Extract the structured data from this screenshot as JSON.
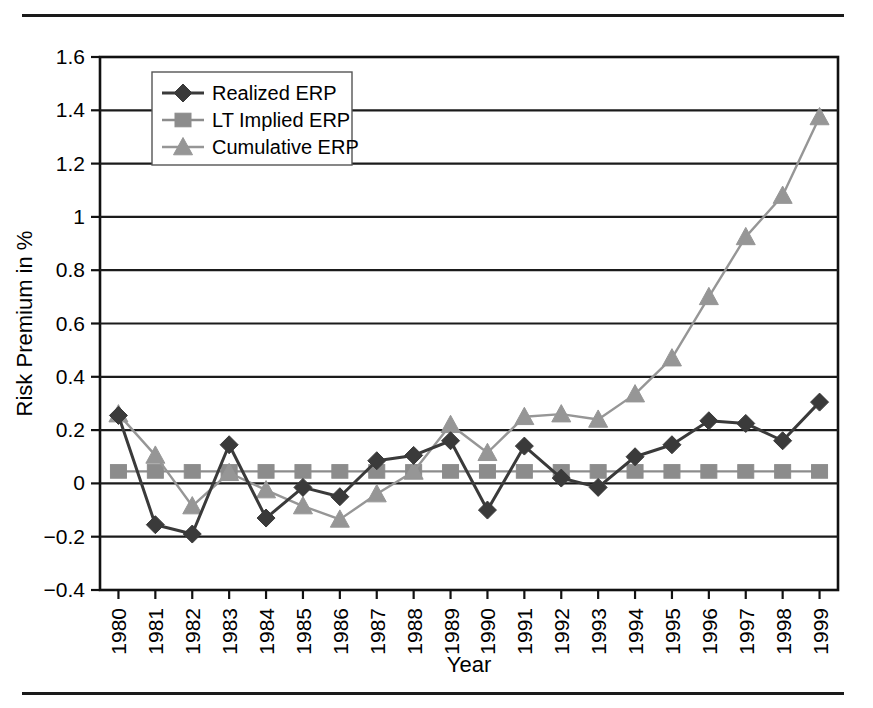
{
  "figure": {
    "top_rule": "horizontal-rule",
    "bottom_rule": "horizontal-rule"
  },
  "chart_data": {
    "type": "line",
    "title": "",
    "xlabel": "Year",
    "ylabel": "Risk Premium in %",
    "categories": [
      "1980",
      "1981",
      "1982",
      "1983",
      "1984",
      "1985",
      "1986",
      "1987",
      "1988",
      "1989",
      "1990",
      "1991",
      "1992",
      "1993",
      "1994",
      "1995",
      "1996",
      "1997",
      "1998",
      "1999"
    ],
    "x": [
      1980,
      1981,
      1982,
      1983,
      1984,
      1985,
      1986,
      1987,
      1988,
      1989,
      1990,
      1991,
      1992,
      1993,
      1994,
      1995,
      1996,
      1997,
      1998,
      1999
    ],
    "ylim": [
      -0.4,
      1.6
    ],
    "yticks": [
      -0.4,
      -0.2,
      0,
      0.2,
      0.4,
      0.6,
      0.8,
      1,
      1.2,
      1.4,
      1.6
    ],
    "ytick_labels": [
      "-0.4",
      "-0.2",
      "0",
      "0.2",
      "0.4",
      "0.6",
      "0.8",
      "1",
      "1.2",
      "1.4",
      "1.6"
    ],
    "grid": true,
    "legend_position": "top-left",
    "series": [
      {
        "name": "Realized ERP",
        "marker": "diamond",
        "color": "#3a3a3a",
        "values": [
          0.255,
          -0.155,
          -0.19,
          0.145,
          -0.13,
          -0.015,
          -0.05,
          0.085,
          0.105,
          0.16,
          -0.1,
          0.14,
          0.02,
          -0.015,
          0.1,
          0.145,
          0.235,
          0.225,
          0.16,
          0.305
        ]
      },
      {
        "name": "LT Implied ERP",
        "marker": "square",
        "color": "#8c8c8c",
        "values": [
          0.045,
          0.045,
          0.045,
          0.045,
          0.045,
          0.045,
          0.045,
          0.045,
          0.045,
          0.045,
          0.045,
          0.045,
          0.045,
          0.045,
          0.045,
          0.045,
          0.045,
          0.045,
          0.045,
          0.045
        ]
      },
      {
        "name": "Cumulative ERP",
        "marker": "triangle",
        "color": "#969696",
        "values": [
          0.26,
          0.105,
          -0.085,
          0.04,
          -0.025,
          -0.085,
          -0.135,
          -0.04,
          0.045,
          0.22,
          0.115,
          0.25,
          0.26,
          0.24,
          0.335,
          0.47,
          0.7,
          0.925,
          1.08,
          1.375
        ]
      }
    ]
  }
}
